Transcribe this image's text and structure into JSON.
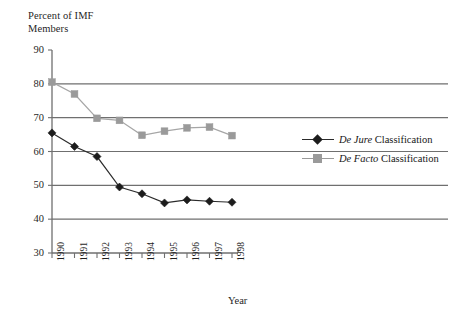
{
  "chart_data": {
    "type": "line",
    "title": "",
    "ylabel": "Percent of IMF\nMembers",
    "xlabel": "Year",
    "categories": [
      "1990",
      "1991",
      "1992",
      "1993",
      "1994",
      "1995",
      "1996",
      "1997",
      "1998"
    ],
    "x": [
      1990,
      1991,
      1992,
      1993,
      1994,
      1995,
      1996,
      1997,
      1998
    ],
    "ylim": [
      30,
      90
    ],
    "yticks": [
      30,
      40,
      50,
      60,
      70,
      80,
      90
    ],
    "grid": "horizontal",
    "legend_position": "right",
    "series": [
      {
        "name": "De Jure Classification",
        "name_italic_prefix": "De Jure",
        "name_rest": " Classification",
        "marker": "diamond",
        "color": "#1c1c1c",
        "line_color": "#2b2b2b",
        "values": [
          65.5,
          61.5,
          58.5,
          49.5,
          47.5,
          44.8,
          45.7,
          45.3,
          45.0
        ]
      },
      {
        "name": "De Facto Classification",
        "name_italic_prefix": "De Facto",
        "name_rest": " Classification",
        "marker": "square",
        "color": "#9a9a9a",
        "line_color": "#a6a6a6",
        "values": [
          80.5,
          77.0,
          69.8,
          69.2,
          64.8,
          66.0,
          67.0,
          67.2,
          64.7
        ]
      }
    ]
  },
  "axes": {
    "ylabel_line1": "Percent of IMF",
    "ylabel_line2": "Members",
    "xlabel": "Year",
    "ytick_labels": [
      "90",
      "80",
      "70",
      "60",
      "50",
      "40",
      "30"
    ],
    "xtick_labels": [
      "1990",
      "1991",
      "1992",
      "1993",
      "1994",
      "1995",
      "1996",
      "1997",
      "1998"
    ]
  },
  "legend": {
    "items": [
      {
        "italic": "De Jure",
        "rest": " Classification"
      },
      {
        "italic": "De Facto",
        "rest": " Classification"
      }
    ]
  },
  "colors": {
    "de_jure": "#1c1c1c",
    "de_facto": "#9a9a9a",
    "gridline": "#6f6f6f",
    "axis": "#6f6f6f",
    "background": "#ffffff"
  }
}
